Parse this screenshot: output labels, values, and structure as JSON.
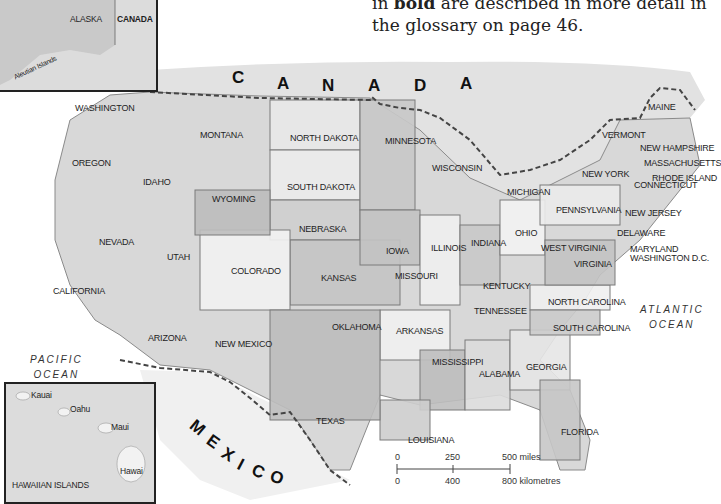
{
  "caption": {
    "line1_prefix": "in ",
    "line1_bold": "bold",
    "line1_suffix": " are described in more detail in",
    "line2": "the glossary on page 46."
  },
  "countries": {
    "canada": [
      "C",
      "A",
      "N",
      "A",
      "D",
      "A"
    ],
    "mexico": [
      "M",
      "E",
      "X",
      "I",
      "C",
      "O"
    ]
  },
  "oceans": {
    "pacific": [
      "PACIFIC",
      "OCEAN"
    ],
    "atlantic": [
      "ATLANTIC",
      "OCEAN"
    ]
  },
  "alaska_inset": {
    "alaska": "ALASKA",
    "canada": "CANADA",
    "aleutian": "Aleutian Islands"
  },
  "hawaii_inset": {
    "title": "HAWAIIAN ISLANDS",
    "islands": [
      "Kauai",
      "Oahu",
      "Maui",
      "Hawai"
    ]
  },
  "states": [
    {
      "name": "WASHINGTON",
      "x": 75,
      "y": 103
    },
    {
      "name": "OREGON",
      "x": 72,
      "y": 158
    },
    {
      "name": "IDAHO",
      "x": 143,
      "y": 177
    },
    {
      "name": "MONTANA",
      "x": 200,
      "y": 130
    },
    {
      "name": "WYOMING",
      "x": 212,
      "y": 194
    },
    {
      "name": "NEVADA",
      "x": 99,
      "y": 237
    },
    {
      "name": "UTAH",
      "x": 167,
      "y": 252
    },
    {
      "name": "CALIFORNIA",
      "x": 53,
      "y": 286
    },
    {
      "name": "COLORADO",
      "x": 231,
      "y": 266
    },
    {
      "name": "ARIZONA",
      "x": 148,
      "y": 333
    },
    {
      "name": "NEW MEXICO",
      "x": 215,
      "y": 339
    },
    {
      "name": "NORTH DAKOTA",
      "x": 290,
      "y": 133
    },
    {
      "name": "SOUTH DAKOTA",
      "x": 287,
      "y": 182
    },
    {
      "name": "NEBRASKA",
      "x": 299,
      "y": 224
    },
    {
      "name": "KANSAS",
      "x": 321,
      "y": 273
    },
    {
      "name": "OKLAHOMA",
      "x": 332,
      "y": 322
    },
    {
      "name": "TEXAS",
      "x": 316,
      "y": 416
    },
    {
      "name": "MINNESOTA",
      "x": 385,
      "y": 136
    },
    {
      "name": "IOWA",
      "x": 386,
      "y": 246
    },
    {
      "name": "MISSOURI",
      "x": 395,
      "y": 271
    },
    {
      "name": "ARKANSAS",
      "x": 396,
      "y": 326
    },
    {
      "name": "LOUISIANA",
      "x": 408,
      "y": 435
    },
    {
      "name": "WISCONSIN",
      "x": 432,
      "y": 163
    },
    {
      "name": "ILLINOIS",
      "x": 431,
      "y": 243
    },
    {
      "name": "MICHIGAN",
      "x": 507,
      "y": 187
    },
    {
      "name": "INDIANA",
      "x": 471,
      "y": 238
    },
    {
      "name": "OHIO",
      "x": 515,
      "y": 228
    },
    {
      "name": "KENTUCKY",
      "x": 483,
      "y": 281
    },
    {
      "name": "TENNESSEE",
      "x": 474,
      "y": 306
    },
    {
      "name": "MISSISSIPPI",
      "x": 432,
      "y": 357
    },
    {
      "name": "ALABAMA",
      "x": 479,
      "y": 369
    },
    {
      "name": "GEORGIA",
      "x": 526,
      "y": 362
    },
    {
      "name": "FLORIDA",
      "x": 561,
      "y": 427
    },
    {
      "name": "SOUTH CAROLINA",
      "x": 553,
      "y": 323
    },
    {
      "name": "NORTH CAROLINA",
      "x": 548,
      "y": 297
    },
    {
      "name": "VIRGINIA",
      "x": 574,
      "y": 259
    },
    {
      "name": "WEST VIRGINIA",
      "x": 541,
      "y": 243
    },
    {
      "name": "PENNSYLVANIA",
      "x": 556,
      "y": 205
    },
    {
      "name": "NEW YORK",
      "x": 582,
      "y": 169
    },
    {
      "name": "VERMONT",
      "x": 602,
      "y": 130
    },
    {
      "name": "MAINE",
      "x": 648,
      "y": 102
    },
    {
      "name": "NEW HAMPSHIRE",
      "x": 640,
      "y": 143
    },
    {
      "name": "MASSACHUSETTS",
      "x": 644,
      "y": 158
    },
    {
      "name": "RHODE ISLAND",
      "x": 652,
      "y": 173
    },
    {
      "name": "CONNECTICUT",
      "x": 634,
      "y": 180
    },
    {
      "name": "NEW JERSEY",
      "x": 625,
      "y": 208
    },
    {
      "name": "DELAWARE",
      "x": 617,
      "y": 228
    },
    {
      "name": "MARYLAND",
      "x": 630,
      "y": 244
    },
    {
      "name": "WASHINGTON D.C.",
      "x": 630,
      "y": 253
    }
  ],
  "scale": {
    "miles_ticks": [
      "0",
      "250",
      "500 miles"
    ],
    "km_ticks": [
      "0",
      "400",
      "800 kilometres"
    ]
  },
  "colors": {
    "land_light": "#e8e8e8",
    "land_mid": "#cfcfcf",
    "land_dark": "#b5b5b5",
    "border": "#7a7a7a",
    "intl_border": "#444444"
  }
}
